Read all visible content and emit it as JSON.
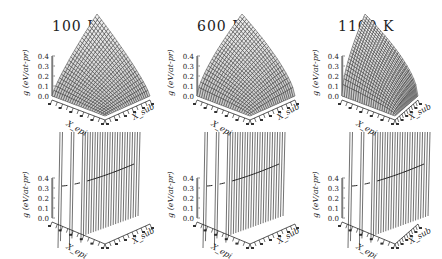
{
  "figure": {
    "columns": [
      {
        "title": "100 K"
      },
      {
        "title": "600 K"
      },
      {
        "title": "1100 K"
      }
    ],
    "rows": [
      "surface",
      "sliced-curves"
    ],
    "z_axis_label": "g (eV/at-pr)",
    "z_ticks": [
      "0.0",
      "0.1",
      "0.2",
      "0.3",
      "0.4"
    ],
    "x_axis_label": "X_epi",
    "y_axis_label": "X_sub",
    "colors": {
      "line": "#111111",
      "background": "#ffffff"
    }
  },
  "chart_data": [
    {
      "type": "surface",
      "panel": "top-left",
      "title": "100 K",
      "zlabel": "g (eV/at-pr)",
      "xlabel": "X_epi",
      "ylabel": "X_sub",
      "zlim": [
        0.0,
        0.4
      ],
      "zticks": [
        0.0,
        0.1,
        0.2,
        0.3,
        0.4
      ],
      "peak_z": 0.4
    },
    {
      "type": "surface",
      "panel": "top-middle",
      "title": "600 K",
      "zlabel": "g (eV/at-pr)",
      "xlabel": "X_epi",
      "ylabel": "X_sub",
      "zlim": [
        0.0,
        0.4
      ],
      "zticks": [
        0.0,
        0.1,
        0.2,
        0.3,
        0.4
      ],
      "peak_z": 0.4
    },
    {
      "type": "surface",
      "panel": "top-right",
      "title": "1100 K",
      "zlabel": "g (eV/at-pr)",
      "xlabel": "X_epi",
      "ylabel": "X_sub",
      "zlim": [
        0.0,
        0.4
      ],
      "zticks": [
        0.0,
        0.1,
        0.2,
        0.3,
        0.4
      ],
      "peak_z": 0.4
    },
    {
      "type": "line",
      "panel": "bottom-left",
      "title": "100 K",
      "zlabel": "g (eV/at-pr)",
      "xlabel": "X_epi",
      "ylabel": "X_sub",
      "zlim": [
        0.0,
        0.4
      ],
      "zticks": [
        0.0,
        0.1,
        0.2,
        0.3,
        0.4
      ]
    },
    {
      "type": "line",
      "panel": "bottom-middle",
      "title": "600 K",
      "zlabel": "g (eV/at-pr)",
      "xlabel": "X_epi",
      "ylabel": "X_sub",
      "zlim": [
        0.0,
        0.4
      ],
      "zticks": [
        0.0,
        0.1,
        0.2,
        0.3,
        0.4
      ]
    },
    {
      "type": "line",
      "panel": "bottom-right",
      "title": "1100 K",
      "zlabel": "g (eV/at-pr)",
      "xlabel": "X_epi",
      "ylabel": "X_sub",
      "zlim": [
        0.0,
        0.4
      ],
      "zticks": [
        0.0,
        0.1,
        0.2,
        0.3,
        0.4
      ]
    }
  ]
}
